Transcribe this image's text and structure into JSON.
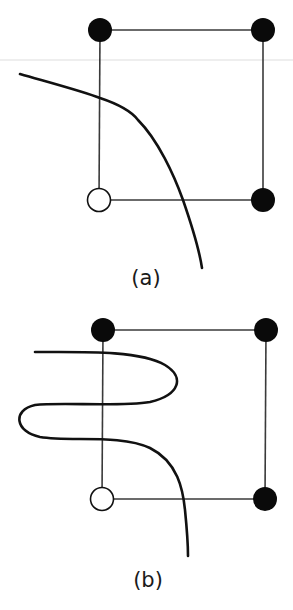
{
  "figure": {
    "panels": [
      {
        "id": "a",
        "label": "(a)",
        "nodes": [
          {
            "position": "top-left",
            "state": "filled",
            "color": "#0a0a0a"
          },
          {
            "position": "top-right",
            "state": "filled",
            "color": "#0a0a0a"
          },
          {
            "position": "bottom-right",
            "state": "filled",
            "color": "#0a0a0a"
          },
          {
            "position": "bottom-left",
            "state": "open",
            "color": "#ffffff"
          }
        ],
        "edges": [
          "top-left—top-right",
          "top-right—bottom-right",
          "bottom-right—bottom-left",
          "bottom-left—top-left"
        ],
        "curve": "single smooth contour crossing left edge and bottom edge, separating open node from filled nodes"
      },
      {
        "id": "b",
        "label": "(b)",
        "nodes": [
          {
            "position": "top-left",
            "state": "filled",
            "color": "#0a0a0a"
          },
          {
            "position": "top-right",
            "state": "filled",
            "color": "#0a0a0a"
          },
          {
            "position": "bottom-right",
            "state": "filled",
            "color": "#0a0a0a"
          },
          {
            "position": "bottom-left",
            "state": "open",
            "color": "#ffffff"
          }
        ],
        "edges": [
          "top-left—top-right",
          "top-right—bottom-right",
          "bottom-right—bottom-left",
          "bottom-left—top-left"
        ],
        "curve": "wiggly contour crossing left edge three times and bottom edge once"
      }
    ]
  }
}
